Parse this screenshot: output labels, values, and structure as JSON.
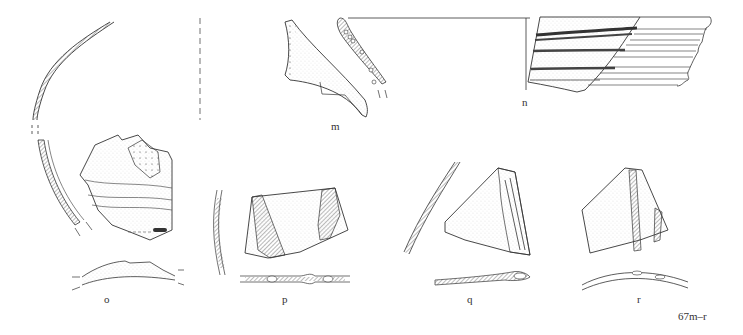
{
  "figure": {
    "caption": "67m–r",
    "sherds": [
      {
        "id": "m",
        "label": "m"
      },
      {
        "id": "n",
        "label": "n"
      },
      {
        "id": "o",
        "label": "o"
      },
      {
        "id": "p",
        "label": "p"
      },
      {
        "id": "q",
        "label": "q"
      },
      {
        "id": "r",
        "label": "r"
      }
    ]
  }
}
